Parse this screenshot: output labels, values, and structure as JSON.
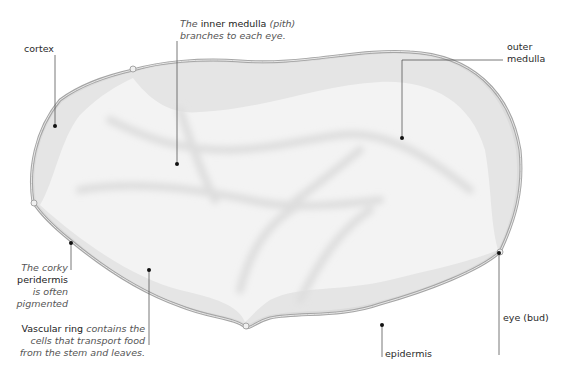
{
  "colors": {
    "epidermis": "#a8a8a8",
    "cortex": "#e6e6e6",
    "medulla": "#f3f3f3",
    "pith_streaks": "#e2e2e2",
    "leader": "#555555",
    "dot": "#111111"
  },
  "labels": {
    "cortex": "cortex",
    "inner_medulla": {
      "prefix": "The",
      "bold": "inner medulla",
      "paren": "(pith)",
      "line2": "branches to each eye."
    },
    "outer_medulla": {
      "line1": "outer",
      "line2": "medulla"
    },
    "peridermis": {
      "line1": "The corky",
      "bold": "peridermis",
      "line3": "is often",
      "line4": "pigmented"
    },
    "vascular_ring": {
      "bold": "Vascular ring",
      "line1_rest": "contains the",
      "line2": "cells that transport food",
      "line3": "from the stem and leaves."
    },
    "eye": "eye (bud)",
    "epidermis": "epidermis"
  }
}
